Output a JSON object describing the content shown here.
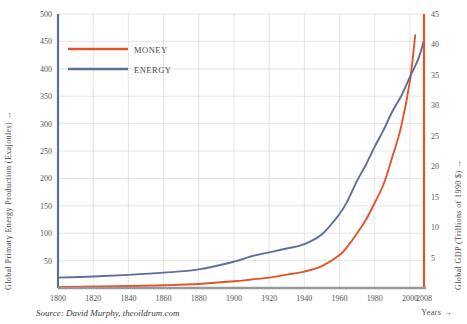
{
  "chart_data": {
    "type": "line",
    "title": "",
    "xlabel": "Years →",
    "ylabel": "Global Primary Energy Production (Exajoules) →",
    "y2label": "Global GDP (Trillions of 1990 $) →",
    "source": "Source: David Murphy, theoildrum.com",
    "xlim": [
      1800,
      2008
    ],
    "ylim": [
      0,
      500
    ],
    "y2lim": [
      0,
      45
    ],
    "grid": true,
    "legend_position": "top-left",
    "x_ticks": [
      1800,
      1820,
      1840,
      1860,
      1880,
      1900,
      1920,
      1940,
      1960,
      1980,
      2000,
      2008
    ],
    "x_tick_labels": [
      "1800",
      "1820",
      "1840",
      "1860",
      "1880",
      "1900",
      "1920",
      "1940",
      "1960",
      "1980",
      "2000",
      "2008"
    ],
    "y_ticks": [
      0,
      50,
      100,
      150,
      200,
      250,
      300,
      350,
      400,
      450,
      500
    ],
    "y_tick_labels": [
      "0",
      "50",
      "100",
      "150",
      "200",
      "250",
      "300",
      "350",
      "400",
      "450",
      "500"
    ],
    "y2_ticks": [
      0,
      5,
      10,
      15,
      20,
      25,
      30,
      35,
      40,
      45
    ],
    "y2_tick_labels": [
      "0",
      "5",
      "10",
      "15",
      "20",
      "25",
      "30",
      "35",
      "40",
      "45"
    ],
    "colors": {
      "money": "#E4542B",
      "energy": "#5E6F9E",
      "grid": "#d4d4d4",
      "baseline": "#999999",
      "text": "#4a4a4a"
    },
    "series": [
      {
        "name": "Money",
        "label": "Money",
        "axis": "right",
        "color": "#E4542B",
        "unit": "Trillions of 1990 $",
        "x": [
          1800,
          1820,
          1840,
          1860,
          1880,
          1900,
          1910,
          1920,
          1930,
          1940,
          1950,
          1960,
          1965,
          1970,
          1975,
          1980,
          1985,
          1990,
          1995,
          2000,
          2003
        ],
        "values": [
          0.18,
          0.25,
          0.33,
          0.45,
          0.65,
          1.1,
          1.4,
          1.7,
          2.2,
          2.7,
          3.6,
          5.4,
          7.0,
          9.0,
          11.2,
          14.0,
          17.0,
          21.5,
          26.5,
          34.0,
          41.5
        ]
      },
      {
        "name": "Energy",
        "label": "Energy",
        "axis": "left",
        "color": "#5E6F9E",
        "unit": "Exajoules",
        "x": [
          1800,
          1820,
          1840,
          1860,
          1880,
          1900,
          1910,
          1920,
          1930,
          1940,
          1950,
          1960,
          1965,
          1970,
          1975,
          1980,
          1985,
          1990,
          1995,
          2000,
          2005,
          2008
        ],
        "values": [
          19,
          21,
          24,
          28,
          34,
          48,
          58,
          65,
          72,
          80,
          98,
          135,
          162,
          196,
          225,
          258,
          288,
          322,
          350,
          385,
          420,
          452
        ]
      }
    ],
    "annotations": {
      "crossover_year": 2000
    }
  },
  "legend": {
    "items": [
      {
        "label": "Money",
        "color": "#E4542B"
      },
      {
        "label": "Energy",
        "color": "#5E6F9E"
      }
    ]
  }
}
